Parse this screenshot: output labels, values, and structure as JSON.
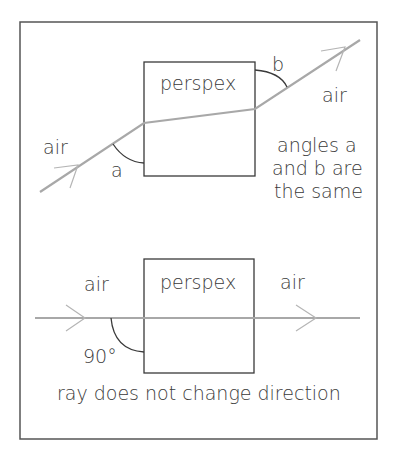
{
  "top_diagram": {
    "block_label": "perspex",
    "left_medium": "air",
    "right_medium": "air",
    "angle_in": "a",
    "angle_out": "b",
    "note_lines": [
      "angles a",
      "and b are",
      "the same"
    ]
  },
  "bottom_diagram": {
    "block_label": "perspex",
    "left_medium": "air",
    "right_medium": "air",
    "angle": "90°",
    "caption": "ray does not change direction"
  },
  "colors": {
    "ray": "#a8a8a8",
    "outline": "#3a3a3a"
  }
}
